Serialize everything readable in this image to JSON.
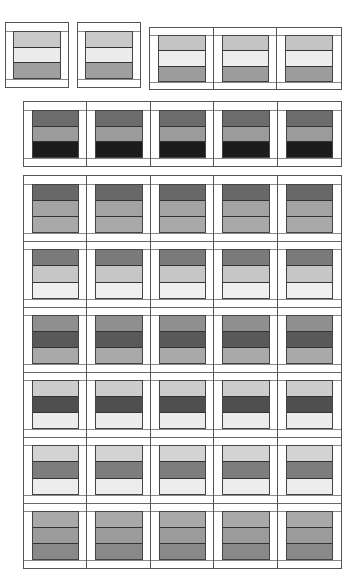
{
  "figure": {
    "groups": [
      {
        "id": "group-single-a",
        "rows": 1,
        "cols": 1,
        "box": {
          "x": 5,
          "y": 22,
          "w": 64,
          "h": 66
        },
        "row_stripes": [
          [
            "#c9c9c9",
            "#ececec",
            "#9f9f9f"
          ]
        ]
      },
      {
        "id": "group-single-b",
        "rows": 1,
        "cols": 1,
        "box": {
          "x": 77,
          "y": 22,
          "w": 64,
          "h": 66
        },
        "row_stripes": [
          [
            "#c9c9c9",
            "#ececec",
            "#9f9f9f"
          ]
        ]
      },
      {
        "id": "group-triple",
        "rows": 1,
        "cols": 3,
        "box": {
          "x": 149,
          "y": 27,
          "w": 193,
          "h": 63
        },
        "row_stripes": [
          [
            "#c4c4c4",
            "#ededed",
            "#9c9c9c"
          ]
        ]
      },
      {
        "id": "group-row-of-five",
        "rows": 1,
        "cols": 5,
        "box": {
          "x": 23,
          "y": 101,
          "w": 319,
          "h": 66
        },
        "row_stripes": [
          [
            "#6c6c6c",
            "#9b9b9b",
            "#1c1c1c"
          ]
        ]
      },
      {
        "id": "group-grid-six-by-five",
        "rows": 6,
        "cols": 5,
        "box": {
          "x": 23,
          "y": 175,
          "w": 319,
          "h": 394
        },
        "row_stripes": [
          [
            "#686868",
            "#a3a3a3",
            "#a9a9a9"
          ],
          [
            "#7a7a7a",
            "#c6c6c6",
            "#efefef"
          ],
          [
            "#8f8f8f",
            "#595959",
            "#a9a9a9"
          ],
          [
            "#cdcdcd",
            "#4f4f4f",
            "#ececec"
          ],
          [
            "#d3d3d3",
            "#7d7d7d",
            "#ededed"
          ],
          [
            "#a9a9a9",
            "#9b9b9b",
            "#898989"
          ]
        ]
      }
    ]
  }
}
